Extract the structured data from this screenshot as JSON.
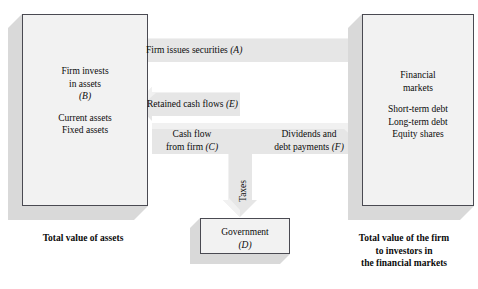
{
  "diagram": {
    "colors": {
      "box_face": "#f2f2f2",
      "box_border": "#4a4a52",
      "box_shadow": "#d9d9d9",
      "band": "#e4e4e4",
      "band_highlight": "#f0f0f0",
      "background": "#ffffff",
      "text": "#0b0b0b"
    }
  },
  "firm_box": {
    "name": "firm",
    "line1": "Firm invests",
    "line2": "in assets",
    "letter": "(B)",
    "item1": "Current assets",
    "item2": "Fixed assets"
  },
  "markets_box": {
    "name": "financial-markets",
    "line1": "Financial",
    "line2": "markets",
    "item1": "Short-term debt",
    "item2": "Long-term debt",
    "item3": "Equity shares"
  },
  "government_box": {
    "name": "government",
    "line1": "Government",
    "letter": "(D)"
  },
  "flows": [
    {
      "id": "A",
      "label_text": "Firm issues securities",
      "label_letter": "(A)",
      "direction": "right-to-left",
      "from": "financial-markets",
      "to": "firm"
    },
    {
      "id": "E",
      "label_text": "Retained cash flows",
      "label_letter": "(E)",
      "direction": "right-to-left",
      "from": "cash-flow-junction",
      "to": "firm"
    },
    {
      "id": "C",
      "label_line1": "Cash flow",
      "label_line2": "from firm",
      "label_letter": "(C)",
      "direction": "left-to-right",
      "from": "firm",
      "to": "cash-flow-junction"
    },
    {
      "id": "F",
      "label_line1": "Dividends and",
      "label_line2": "debt payments",
      "label_letter": "(F)",
      "direction": "left-to-right",
      "from": "cash-flow-junction",
      "to": "financial-markets"
    },
    {
      "id": "Taxes",
      "label_text": "Taxes",
      "direction": "top-to-bottom",
      "from": "cash-flow-junction",
      "to": "government"
    }
  ],
  "captions": {
    "assets": "Total value of assets",
    "markets_line1": "Total value of the firm",
    "markets_line2": "to investors in",
    "markets_line3": "the financial markets"
  }
}
